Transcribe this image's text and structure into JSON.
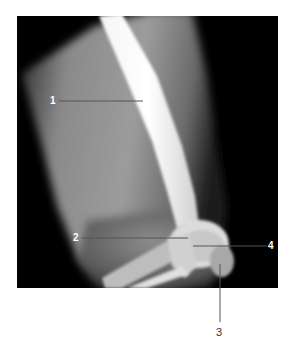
{
  "figure": {
    "type": "lateral knee radiograph",
    "background_color": "#ffffff",
    "image_background_color": "#000000",
    "leader_line_color": "#555555",
    "labels": [
      {
        "id": "1",
        "text": "1"
      },
      {
        "id": "2",
        "text": "2"
      },
      {
        "id": "3",
        "text": "3"
      },
      {
        "id": "4",
        "text": "4"
      }
    ]
  }
}
